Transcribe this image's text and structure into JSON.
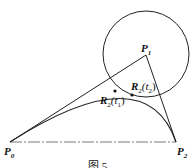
{
  "diagram": {
    "points": {
      "P0": {
        "label": "P",
        "sub": "0",
        "x": 10,
        "y": 142
      },
      "P1": {
        "label": "P",
        "sub": "1",
        "x": 146,
        "y": 55
      },
      "P2": {
        "label": "P",
        "sub": "2",
        "x": 176,
        "y": 142
      }
    },
    "circle": {
      "cx": 146,
      "cy": 54,
      "r": 43
    },
    "curve_points": [
      {
        "label": "R",
        "sub": "2",
        "arg": "(t",
        "argsub": "1",
        "close": ")",
        "x": 115,
        "y": 91
      },
      {
        "label": "R",
        "sub": "2",
        "arg": "(t",
        "argsub": "2",
        "close": ")",
        "x": 132,
        "y": 95
      }
    ],
    "caption": "图 5"
  }
}
